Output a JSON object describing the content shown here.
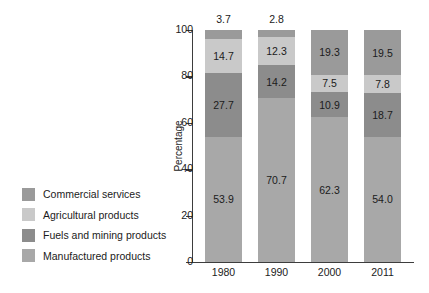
{
  "chart_data": {
    "type": "bar",
    "subtype": "stacked-bar-100-percent",
    "title": "",
    "xlabel": "",
    "ylabel": "Percentage",
    "ylim": [
      0,
      100
    ],
    "yticks": [
      0,
      20,
      40,
      60,
      80,
      100
    ],
    "ytick_labels": [
      "0",
      "20",
      "40",
      "60",
      "80",
      "100"
    ],
    "grid": false,
    "legend_position": "left-outside",
    "categories": [
      "1980",
      "1990",
      "2000",
      "2011"
    ],
    "series": [
      {
        "name": "Manufactured products",
        "color": "#a8a8a8",
        "values": [
          53.9,
          70.7,
          62.3,
          54.0
        ],
        "labels": [
          "53.9",
          "70.7",
          "62.3",
          "54.0"
        ],
        "label_position": "inside"
      },
      {
        "name": "Fuels and mining products",
        "color": "#8c8c8c",
        "values": [
          27.7,
          14.2,
          10.9,
          18.7
        ],
        "labels": [
          "27.7",
          "14.2",
          "10.9",
          "18.7"
        ],
        "label_position": "inside"
      },
      {
        "name": "Agricultural products",
        "color": "#c9c9c9",
        "values": [
          14.7,
          12.3,
          7.5,
          7.8
        ],
        "labels": [
          "14.7",
          "12.3",
          "7.5",
          "7.8"
        ],
        "label_position": "inside"
      },
      {
        "name": "Commercial services",
        "color": "#9a9a9a",
        "values": [
          3.7,
          2.8,
          19.3,
          19.5
        ],
        "labels": [
          "3.7",
          "2.8",
          "19.3",
          "19.5"
        ],
        "label_position": "mixed"
      }
    ]
  },
  "legend": {
    "items": [
      {
        "label": "Commercial services",
        "color": "#9a9a9a"
      },
      {
        "label": "Agricultural products",
        "color": "#c9c9c9"
      },
      {
        "label": "Fuels and mining products",
        "color": "#8c8c8c"
      },
      {
        "label": "Manufactured products",
        "color": "#a8a8a8"
      }
    ]
  },
  "axis": {
    "y_title": "Percentage",
    "y_labels": [
      "100",
      "80",
      "60",
      "40",
      "20",
      "0"
    ],
    "x_labels": [
      "1980",
      "1990",
      "2000",
      "2011"
    ]
  },
  "bars": [
    {
      "category": "1980",
      "outside_label": "3.7",
      "segments": [
        {
          "name": "Manufactured products",
          "value": 53.9,
          "label": "53.9",
          "color": "#a8a8a8",
          "show_label": true
        },
        {
          "name": "Fuels and mining products",
          "value": 27.7,
          "label": "27.7",
          "color": "#8c8c8c",
          "show_label": true
        },
        {
          "name": "Agricultural products",
          "value": 14.7,
          "label": "14.7",
          "color": "#c9c9c9",
          "show_label": true
        },
        {
          "name": "Commercial services",
          "value": 3.7,
          "label": "3.7",
          "color": "#9a9a9a",
          "show_label": false
        }
      ]
    },
    {
      "category": "1990",
      "outside_label": "2.8",
      "segments": [
        {
          "name": "Manufactured products",
          "value": 70.7,
          "label": "70.7",
          "color": "#a8a8a8",
          "show_label": true
        },
        {
          "name": "Fuels and mining products",
          "value": 14.2,
          "label": "14.2",
          "color": "#8c8c8c",
          "show_label": true
        },
        {
          "name": "Agricultural products",
          "value": 12.3,
          "label": "12.3",
          "color": "#c9c9c9",
          "show_label": true
        },
        {
          "name": "Commercial services",
          "value": 2.8,
          "label": "2.8",
          "color": "#9a9a9a",
          "show_label": false
        }
      ]
    },
    {
      "category": "2000",
      "outside_label": "",
      "segments": [
        {
          "name": "Manufactured products",
          "value": 62.3,
          "label": "62.3",
          "color": "#a8a8a8",
          "show_label": true
        },
        {
          "name": "Fuels and mining products",
          "value": 10.9,
          "label": "10.9",
          "color": "#8c8c8c",
          "show_label": true
        },
        {
          "name": "Agricultural products",
          "value": 7.5,
          "label": "7.5",
          "color": "#c9c9c9",
          "show_label": true
        },
        {
          "name": "Commercial services",
          "value": 19.3,
          "label": "19.3",
          "color": "#9a9a9a",
          "show_label": true
        }
      ]
    },
    {
      "category": "2011",
      "outside_label": "",
      "segments": [
        {
          "name": "Manufactured products",
          "value": 54.0,
          "label": "54.0",
          "color": "#a8a8a8",
          "show_label": true
        },
        {
          "name": "Fuels and mining products",
          "value": 18.7,
          "label": "18.7",
          "color": "#8c8c8c",
          "show_label": true
        },
        {
          "name": "Agricultural products",
          "value": 7.8,
          "label": "7.8",
          "color": "#c9c9c9",
          "show_label": true
        },
        {
          "name": "Commercial services",
          "value": 19.5,
          "label": "19.5",
          "color": "#9a9a9a",
          "show_label": true
        }
      ]
    }
  ]
}
